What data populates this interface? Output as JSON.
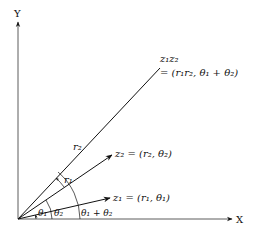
{
  "axes": {
    "x_label": "X",
    "y_label": "Y"
  },
  "vectors": {
    "product": {
      "name_line1": "z₁z₂",
      "name_line2": "= (r₁r₂, θ₁ + θ₂)"
    },
    "z2": {
      "label": "z₂ = (r₂, θ₂)",
      "length_label": "r₂"
    },
    "z1": {
      "label": "z₁ = (r₁, θ₁)",
      "length_label": "r₁"
    }
  },
  "angles": {
    "theta1": "θ₁",
    "theta2": "θ₂",
    "sum": "θ₁ + θ₂"
  }
}
